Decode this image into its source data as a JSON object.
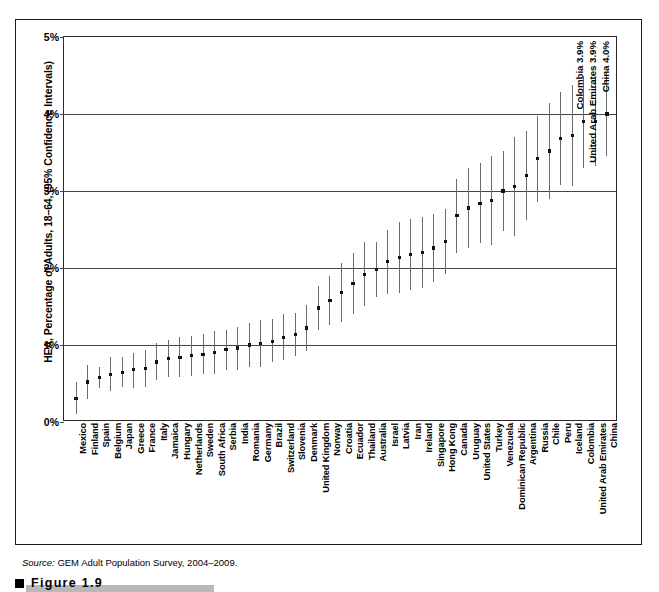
{
  "figure": {
    "caption_label": "Figure   1.9",
    "source_prefix": "Source:",
    "source_text": " GEM Adult Population Survey, 2004–2009."
  },
  "annotations": [
    {
      "text": "Colombia 3.9%"
    },
    {
      "text": "United Arab Emirates 3.9%"
    },
    {
      "text": "China 4.0%"
    }
  ],
  "chart_data": {
    "type": "scatter",
    "title": "",
    "subtitle": "",
    "xlabel": "",
    "ylabel": "HEA, Percentage of Adults, 18–64, (95% Confidence Intervals)",
    "ylim": [
      0,
      5
    ],
    "ytick_labels": [
      "0%",
      "1%",
      "2%",
      "3%",
      "4%",
      "5%"
    ],
    "ytick_values": [
      0,
      1,
      2,
      3,
      4,
      5
    ],
    "grid": true,
    "legend": "none",
    "value_unit": "percent",
    "error_bar_type": "95% confidence interval",
    "categories": [
      "Mexico",
      "Finland",
      "Spain",
      "Belgium",
      "Japan",
      "Greece",
      "France",
      "Italy",
      "Jamaica",
      "Hungary",
      "Netherlands",
      "Sweden",
      "South Africa",
      "Serbia",
      "India",
      "Romania",
      "Germany",
      "Brazil",
      "Switzerland",
      "Slovenia",
      "Denmark",
      "United Kingdom",
      "Norway",
      "Croatia",
      "Ecuador",
      "Thailand",
      "Australia",
      "Israel",
      "Latvia",
      "Iran",
      "Ireland",
      "Singapore",
      "Hong Kong",
      "Canada",
      "Uruguay",
      "United States",
      "Turkey",
      "Venezuela",
      "Dominican Republic",
      "Argentina",
      "Russia",
      "Chile",
      "Peru",
      "Iceland",
      "Colombia",
      "United Arab Emirates",
      "China"
    ],
    "values": [
      0.3,
      0.52,
      0.58,
      0.62,
      0.64,
      0.68,
      0.7,
      0.78,
      0.82,
      0.84,
      0.86,
      0.88,
      0.9,
      0.94,
      0.96,
      1.0,
      1.02,
      1.05,
      1.1,
      1.14,
      1.22,
      1.48,
      1.58,
      1.68,
      1.8,
      1.92,
      1.98,
      2.08,
      2.14,
      2.18,
      2.2,
      2.26,
      2.34,
      2.68,
      2.78,
      2.84,
      2.88,
      3.0,
      3.06,
      3.2,
      3.42,
      3.52,
      3.68,
      3.72,
      3.9,
      3.9,
      4.0
    ],
    "ci_low": [
      0.1,
      0.3,
      0.44,
      0.4,
      0.45,
      0.44,
      0.46,
      0.55,
      0.58,
      0.58,
      0.6,
      0.62,
      0.62,
      0.68,
      0.68,
      0.72,
      0.72,
      0.78,
      0.8,
      0.86,
      0.92,
      1.2,
      1.26,
      1.3,
      1.4,
      1.5,
      1.62,
      1.66,
      1.68,
      1.72,
      1.74,
      1.82,
      1.92,
      2.2,
      2.26,
      2.32,
      2.3,
      2.48,
      2.42,
      2.62,
      2.86,
      2.9,
      3.08,
      3.06,
      3.3,
      3.32,
      3.46
    ],
    "ci_high": [
      0.52,
      0.74,
      0.72,
      0.84,
      0.84,
      0.9,
      0.94,
      1.02,
      1.06,
      1.1,
      1.12,
      1.14,
      1.18,
      1.2,
      1.24,
      1.28,
      1.32,
      1.34,
      1.4,
      1.42,
      1.52,
      1.76,
      1.9,
      2.06,
      2.2,
      2.34,
      2.34,
      2.5,
      2.6,
      2.64,
      2.66,
      2.7,
      2.76,
      3.16,
      3.3,
      3.36,
      3.46,
      3.52,
      3.7,
      3.78,
      3.98,
      4.14,
      4.28,
      4.38,
      4.5,
      4.48,
      4.54
    ]
  }
}
